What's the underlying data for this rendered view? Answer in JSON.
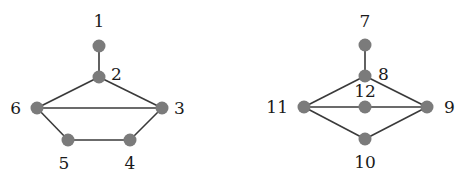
{
  "diagram": {
    "type": "graph",
    "graphs": [
      {
        "name": "left-graph",
        "nodes": [
          {
            "id": "1",
            "label": "1",
            "x": 99,
            "y": 46,
            "lx": 99,
            "ly": 27,
            "anchor": "middle"
          },
          {
            "id": "2",
            "label": "2",
            "x": 99,
            "y": 77,
            "lx": 111,
            "ly": 80,
            "anchor": "start"
          },
          {
            "id": "3",
            "label": "3",
            "x": 162,
            "y": 108,
            "lx": 174,
            "ly": 114,
            "anchor": "start"
          },
          {
            "id": "4",
            "label": "4",
            "x": 130,
            "y": 140,
            "lx": 130,
            "ly": 169,
            "anchor": "middle"
          },
          {
            "id": "5",
            "label": "5",
            "x": 68,
            "y": 140,
            "lx": 64,
            "ly": 169,
            "anchor": "middle"
          },
          {
            "id": "6",
            "label": "6",
            "x": 37,
            "y": 108,
            "lx": 21,
            "ly": 114,
            "anchor": "end"
          }
        ],
        "edges": [
          [
            "1",
            "2"
          ],
          [
            "2",
            "6"
          ],
          [
            "2",
            "3"
          ],
          [
            "6",
            "3"
          ],
          [
            "6",
            "5"
          ],
          [
            "5",
            "4"
          ],
          [
            "4",
            "3"
          ]
        ]
      },
      {
        "name": "right-graph",
        "nodes": [
          {
            "id": "7",
            "label": "7",
            "x": 365,
            "y": 45,
            "lx": 365,
            "ly": 27,
            "anchor": "middle"
          },
          {
            "id": "8",
            "label": "8",
            "x": 365,
            "y": 76,
            "lx": 378,
            "ly": 80,
            "anchor": "start"
          },
          {
            "id": "9",
            "label": "9",
            "x": 427,
            "y": 107,
            "lx": 444,
            "ly": 113,
            "anchor": "start"
          },
          {
            "id": "10",
            "label": "10",
            "x": 365,
            "y": 139,
            "lx": 365,
            "ly": 168,
            "anchor": "middle"
          },
          {
            "id": "11",
            "label": "11",
            "x": 304,
            "y": 107,
            "lx": 288,
            "ly": 113,
            "anchor": "end"
          },
          {
            "id": "12",
            "label": "12",
            "x": 365,
            "y": 107,
            "lx": 365,
            "ly": 97,
            "anchor": "middle"
          }
        ],
        "edges": [
          [
            "7",
            "8"
          ],
          [
            "8",
            "11"
          ],
          [
            "8",
            "9"
          ],
          [
            "11",
            "12"
          ],
          [
            "12",
            "9"
          ],
          [
            "11",
            "10"
          ],
          [
            "10",
            "9"
          ]
        ]
      }
    ],
    "colors": {
      "node": "#7b7b7b",
      "edge": "#3a3a3a",
      "label": "#1a1a1a"
    }
  }
}
